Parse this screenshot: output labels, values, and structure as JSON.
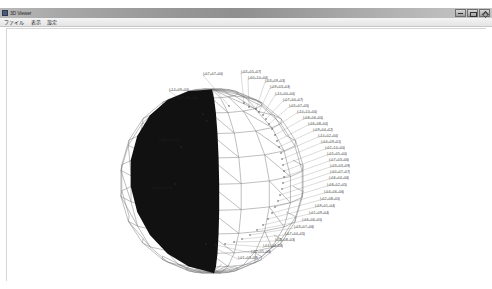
{
  "window": {
    "title": "3D Viewer",
    "icon": "app-icon",
    "controls": [
      {
        "name": "minimize-button",
        "glyph": "minimize-icon"
      },
      {
        "name": "maximize-button",
        "glyph": "maximize-icon"
      },
      {
        "name": "close-button",
        "glyph": "close-icon"
      }
    ]
  },
  "menu": {
    "items": [
      {
        "label": "ファイル"
      },
      {
        "label": "表示"
      },
      {
        "label": "設定"
      }
    ]
  },
  "canvas": {
    "name": "3d-viewport",
    "background": "#ffffff",
    "mesh_color": "#6f6f6f",
    "band_color": "#111111",
    "label_color": "#222222",
    "leader_color": "#9a9a9a"
  },
  "chart_data": {
    "type": "scatter",
    "title": "",
    "xlabel": "",
    "ylabel": "",
    "labels": [
      {
        "text": "(+0.7,+0.7,+0.0)",
        "x": 196,
        "y": 46,
        "vx": 222,
        "vy": 77
      },
      {
        "text": "(+0.5,+0.5,+0.7)",
        "x": 234,
        "y": 44,
        "vx": 237,
        "vy": 74
      },
      {
        "text": "(+0.0,+1.0,+0.0)",
        "x": 241,
        "y": 50,
        "vx": 242,
        "vy": 78
      },
      {
        "text": "(+0.3,+0.9,+0.3)",
        "x": 258,
        "y": 53,
        "vx": 249,
        "vy": 80
      },
      {
        "text": "(+0.9,+0.3,+0.3)",
        "x": 263,
        "y": 59,
        "vx": 252,
        "vy": 83
      },
      {
        "text": "(+1.0,+0.0,+0.0)",
        "x": 268,
        "y": 66,
        "vx": 256,
        "vy": 86
      },
      {
        "text": "(+0.7,+0.0,+0.7)",
        "x": 276,
        "y": 72,
        "vx": 259,
        "vy": 90
      },
      {
        "text": "(+0.5,+0.7,+0.5)",
        "x": 282,
        "y": 78,
        "vx": 262,
        "vy": 95
      },
      {
        "text": "(+1.0,+1.0,+0.0)",
        "x": 290,
        "y": 84,
        "vx": 265,
        "vy": 100
      },
      {
        "text": "(+0.8,+0.6,+0.0)",
        "x": 296,
        "y": 90,
        "vx": 268,
        "vy": 106
      },
      {
        "text": "(+0.6,+0.8,+0.0)",
        "x": 301,
        "y": 96,
        "vx": 270,
        "vy": 112
      },
      {
        "text": "(+0.9,+0.4,+0.2)",
        "x": 306,
        "y": 102,
        "vx": 272,
        "vy": 118
      },
      {
        "text": "(+1.0,+0.2,+0.0)",
        "x": 311,
        "y": 108,
        "vx": 274,
        "vy": 124
      },
      {
        "text": "(+0.4,+0.9,+0.1)",
        "x": 314,
        "y": 114,
        "vx": 275,
        "vy": 130
      },
      {
        "text": "(+0.2,+1.0,+0.0)",
        "x": 318,
        "y": 120,
        "vx": 276,
        "vy": 136
      },
      {
        "text": "(+0.5,+0.5,+0.0)",
        "x": 320,
        "y": 126,
        "vx": 277,
        "vy": 142
      },
      {
        "text": "(+0.7,+0.3,+0.6)",
        "x": 322,
        "y": 132,
        "vx": 277,
        "vy": 148
      },
      {
        "text": "(+0.3,+0.3,+0.9)",
        "x": 323,
        "y": 138,
        "vx": 276,
        "vy": 154
      },
      {
        "text": "(+0.0,+0.7,+0.7)",
        "x": 323,
        "y": 144,
        "vx": 275,
        "vy": 160
      },
      {
        "text": "(+0.6,+0.4,+0.6)",
        "x": 322,
        "y": 150,
        "vx": 273,
        "vy": 166
      },
      {
        "text": "(+0.8,+0.2,+0.5)",
        "x": 320,
        "y": 157,
        "vx": 271,
        "vy": 172
      },
      {
        "text": "(+0.4,+0.6,+0.6)",
        "x": 317,
        "y": 164,
        "vx": 268,
        "vy": 178
      },
      {
        "text": "(+0.2,+0.8,+0.5)",
        "x": 313,
        "y": 171,
        "vx": 265,
        "vy": 184
      },
      {
        "text": "(+0.9,+0.1,+0.4)",
        "x": 308,
        "y": 178,
        "vx": 261,
        "vy": 190
      },
      {
        "text": "(+0.1,+0.9,+0.4)",
        "x": 302,
        "y": 185,
        "vx": 256,
        "vy": 196
      },
      {
        "text": "(+0.6,+0.6,+0.5)",
        "x": 295,
        "y": 192,
        "vx": 250,
        "vy": 201
      },
      {
        "text": "(+0.3,+0.7,+0.6)",
        "x": 287,
        "y": 199,
        "vx": 243,
        "vy": 206
      },
      {
        "text": "(+0.7,+0.4,+0.5)",
        "x": 278,
        "y": 206,
        "vx": 235,
        "vy": 210
      },
      {
        "text": "(+0.5,+0.8,+0.3)",
        "x": 268,
        "y": 212,
        "vx": 227,
        "vy": 213
      },
      {
        "text": "(+0.4,+0.4,+0.8)",
        "x": 256,
        "y": 218,
        "vx": 218,
        "vy": 215
      },
      {
        "text": "(+0.2,+0.5,+0.8)",
        "x": 244,
        "y": 224,
        "vx": 209,
        "vy": 216
      },
      {
        "text": "(+0.1,+0.3,+0.9)",
        "x": 231,
        "y": 230,
        "vx": 199,
        "vy": 215
      },
      {
        "text": "(+0.8,+0.5,+0.2)",
        "x": 152,
        "y": 112,
        "vx": 174,
        "vy": 118
      },
      {
        "text": "(+0.6,+0.3,+0.7)",
        "x": 145,
        "y": 160,
        "vx": 168,
        "vy": 155
      },
      {
        "text": "(+1.4,+0.9,+0.0)",
        "x": 162,
        "y": 62,
        "vx": 196,
        "vy": 85
      },
      {
        "text": "(+1.2,+0.8,+0.0)",
        "x": 170,
        "y": 70,
        "vx": 200,
        "vy": 92
      }
    ]
  }
}
